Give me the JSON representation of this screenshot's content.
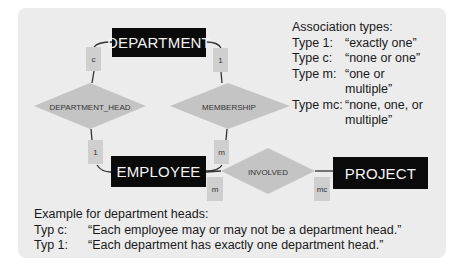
{
  "diagram": {
    "entities": [
      {
        "id": "department",
        "label": "DEPARTMENT"
      },
      {
        "id": "employee",
        "label": "EMPLOYEE"
      },
      {
        "id": "project",
        "label": "PROJECT"
      }
    ],
    "relationships": [
      {
        "id": "department_head",
        "label": "DEPARTMENT_HEAD"
      },
      {
        "id": "membership",
        "label": "MEMBERSHIP"
      },
      {
        "id": "involved",
        "label": "INVOLVED"
      }
    ],
    "cardinalities": {
      "department_to_department_head": "c",
      "department_to_membership": "1",
      "employee_to_department_head": "1",
      "employee_to_membership": "m",
      "employee_to_involved": "m",
      "project_to_involved": "mc"
    },
    "colors": {
      "panel": "#ececec",
      "entity_fill": "#0a0a0a",
      "entity_text": "#f4f4f4",
      "relationship_fill": "#c4c4c4",
      "cardinality_fill": "#cfcfcf",
      "line": "#333333"
    }
  },
  "legend": {
    "title": "Association types:",
    "items": [
      {
        "key": "Type 1:",
        "value": "“exactly one”"
      },
      {
        "key": "Type c:",
        "value": "“none or one”"
      },
      {
        "key": "Type m:",
        "value": "“one or multiple”"
      },
      {
        "key": "Type mc:",
        "value": "“none, one, or multiple”"
      }
    ]
  },
  "example": {
    "title": "Example for department heads:",
    "items": [
      {
        "key": "Typ c:",
        "value": "“Each employee may or may not be a department head.”"
      },
      {
        "key": "Typ 1:",
        "value": "“Each department has exactly one department head.”"
      }
    ]
  }
}
